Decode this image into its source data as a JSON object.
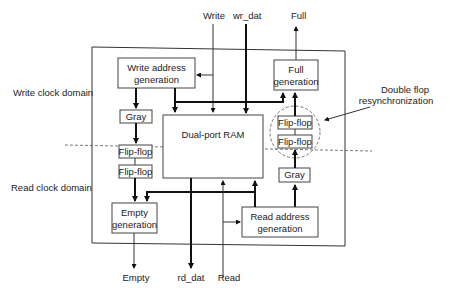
{
  "diagram": {
    "domains": {
      "write": "Write clock domain",
      "read": "Read clock domain"
    },
    "inputs": {
      "write": "Write",
      "wr_dat": "wr_dat",
      "read": "Read"
    },
    "outputs": {
      "full": "Full",
      "empty": "Empty",
      "rd_dat": "rd_dat"
    },
    "blocks": {
      "write_addr_line1": "Write address",
      "write_addr_line2": "generation",
      "full_line1": "Full",
      "full_line2": "generation",
      "gray_write": "Gray",
      "ram": "Dual-port RAM",
      "ff_right_top": "Flip-flop",
      "ff_right_bottom": "Flip-flop",
      "ff_left_top": "Flip-flop",
      "ff_left_bottom": "Flip-flop",
      "gray_read": "Gray",
      "empty_line1": "Empty",
      "empty_line2": "generation",
      "read_addr_line1": "Read address",
      "read_addr_line2": "generation"
    },
    "annotation": {
      "line1": "Double flop",
      "line2": "resynchronization"
    },
    "colors": {
      "line": "#222222",
      "background": "#ffffff",
      "dashed": "#555555"
    }
  }
}
